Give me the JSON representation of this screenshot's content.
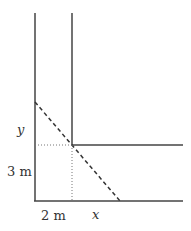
{
  "diagram": {
    "labels": {
      "y": "y",
      "three_m": "3 m",
      "two_m": "2 m",
      "x": "x"
    },
    "colors": {
      "wall": "#444444",
      "ladder": "#333333",
      "guide": "#777777"
    }
  }
}
